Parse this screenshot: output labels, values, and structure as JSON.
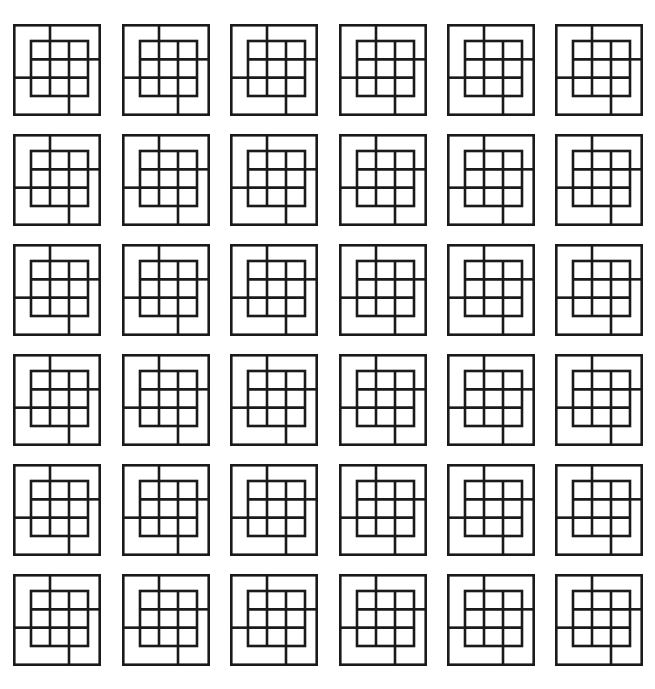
{
  "figure": {
    "canvas_width": 655,
    "canvas_height": 689,
    "background_color": "#ffffff",
    "stroke_color": "#1a1a1a",
    "stroke_width": 2.6,
    "motif_name": "nested-square-grid-tile",
    "motif_count": 36
  },
  "chart_data": {
    "type": "heatmap",
    "subtitle": "",
    "xlabel": "",
    "ylabel": "",
    "grid": true,
    "legend_position": "none",
    "rows": 6,
    "columns": 6,
    "cells_total": 36,
    "categories": [
      "col-1",
      "col-2",
      "col-3",
      "col-4",
      "col-5",
      "col-6"
    ],
    "row_labels": [
      "row-1",
      "row-2",
      "row-3",
      "row-4",
      "row-5",
      "row-6"
    ],
    "values": [
      [
        1,
        1,
        1,
        1,
        1,
        1
      ],
      [
        1,
        1,
        1,
        1,
        1,
        1
      ],
      [
        1,
        1,
        1,
        1,
        1,
        1
      ],
      [
        1,
        1,
        1,
        1,
        1,
        1
      ],
      [
        1,
        1,
        1,
        1,
        1,
        1
      ],
      [
        1,
        1,
        1,
        1,
        1,
        1
      ]
    ],
    "column_x": [
      13,
      121.5,
      230,
      338.5,
      447,
      555
    ],
    "row_y": [
      24,
      134,
      244,
      354,
      464,
      574
    ],
    "tile_width": 88,
    "tile_height": 92,
    "inner_grid_rows": 3,
    "inner_grid_columns": 3,
    "inner_grid_cells": 9,
    "connectors": [
      "top",
      "right",
      "bottom",
      "left"
    ]
  },
  "motif": {
    "outer_square_label": "outer-square",
    "inner_grid_label": "inner-3x3-grid",
    "connector_top_label": "connector-top",
    "connector_right_label": "connector-right",
    "connector_bottom_label": "connector-bottom",
    "connector_left_label": "connector-left"
  }
}
